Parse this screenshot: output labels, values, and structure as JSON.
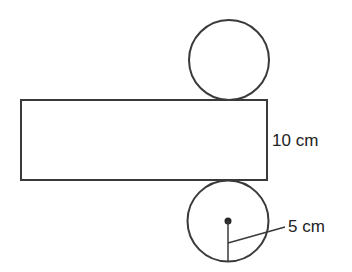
{
  "diagram": {
    "type": "cylinder-net",
    "labels": {
      "height": "10 cm",
      "radius": "5 cm"
    },
    "colors": {
      "stroke": "#3a3a3a",
      "text": "#222222",
      "background": "#ffffff"
    }
  }
}
